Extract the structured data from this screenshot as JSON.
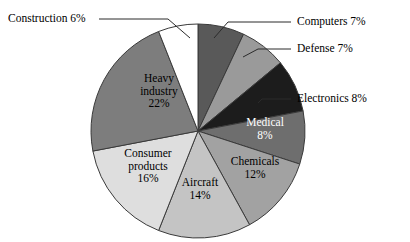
{
  "chart_data": {
    "type": "pie",
    "title": "",
    "subtitle": "",
    "xlabel": "",
    "ylabel": "",
    "legend_position": "none",
    "grid": false,
    "units": "percent",
    "total": 100,
    "start_angle_deg": 0,
    "direction": "clockwise",
    "categories": [
      "Computers",
      "Defense",
      "Electronics",
      "Medical",
      "Chemicals",
      "Aircraft",
      "Consumer products",
      "Heavy industry",
      "Construction"
    ],
    "values": [
      7,
      7,
      8,
      8,
      12,
      14,
      16,
      22,
      6
    ],
    "slices": [
      {
        "name": "Computers",
        "value": 7,
        "label": "Computers 7%",
        "value_label": "7%",
        "color": "#595959",
        "label_placement": "callout"
      },
      {
        "name": "Defense",
        "value": 7,
        "label": "Defense 7%",
        "value_label": "7%",
        "color": "#9a9a9a",
        "label_placement": "callout"
      },
      {
        "name": "Electronics",
        "value": 8,
        "label": "Electronics 8%",
        "value_label": "8%",
        "color": "#1c1c1c",
        "label_placement": "callout"
      },
      {
        "name": "Medical",
        "value": 8,
        "label": "Medical 8%",
        "value_label": "8%",
        "color": "#6e6e6e",
        "label_placement": "inside",
        "label_lines": [
          "Medical",
          "8%"
        ]
      },
      {
        "name": "Chemicals",
        "value": 12,
        "label": "Chemicals 12%",
        "value_label": "12%",
        "color": "#a2a2a2",
        "label_placement": "inside",
        "label_lines": [
          "Chemicals",
          "12%"
        ]
      },
      {
        "name": "Aircraft",
        "value": 14,
        "label": "Aircraft 14%",
        "value_label": "14%",
        "color": "#c4c4c4",
        "label_placement": "inside",
        "label_lines": [
          "Aircraft",
          "14%"
        ]
      },
      {
        "name": "Consumer products",
        "value": 16,
        "label": "Consumer products 16%",
        "value_label": "16%",
        "color": "#dedede",
        "label_placement": "inside",
        "label_lines": [
          "Consumer",
          "products",
          "16%"
        ]
      },
      {
        "name": "Heavy industry",
        "value": 22,
        "label": "Heavy industry 22%",
        "value_label": "22%",
        "color": "#7d7d7d",
        "label_placement": "inside",
        "label_lines": [
          "Heavy",
          "industry",
          "22%"
        ]
      },
      {
        "name": "Construction",
        "value": 6,
        "label": "Construction 6%",
        "value_label": "6%",
        "color": "#ffffff",
        "label_placement": "callout"
      }
    ],
    "callouts": [
      {
        "name": "Construction",
        "text": "Construction 6%",
        "side": "left"
      },
      {
        "name": "Computers",
        "text": "Computers 7%",
        "side": "right"
      },
      {
        "name": "Defense",
        "text": "Defense 7%",
        "side": "right"
      },
      {
        "name": "Electronics",
        "text": "Electronics 8%",
        "side": "right"
      }
    ],
    "background_color": "#ffffff",
    "slice_border_color": "#3a3a3a"
  }
}
